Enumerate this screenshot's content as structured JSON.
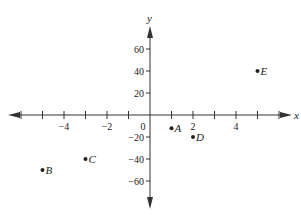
{
  "chart_data": {
    "type": "scatter",
    "title": "",
    "xlabel": "x",
    "ylabel": "y",
    "xlim": [
      -6.8,
      6.5
    ],
    "ylim": [
      -78,
      78
    ],
    "grid": false,
    "legend": null,
    "x_ticks": [
      -6,
      -5,
      -4,
      -3,
      -2,
      -1,
      1,
      2,
      3,
      4,
      5,
      6
    ],
    "x_tick_labels": [
      "-4",
      "-2",
      "0",
      "2",
      "4"
    ],
    "x_tick_label_values": [
      -4,
      -2,
      0,
      2,
      4
    ],
    "y_ticks": [
      -60,
      -40,
      -20,
      20,
      40,
      60
    ],
    "y_tick_labels": [
      "60",
      "40",
      "20",
      "-20",
      "-40",
      "-60"
    ],
    "y_tick_label_values": [
      60,
      40,
      20,
      -20,
      -40,
      -60
    ],
    "points": [
      {
        "label": "A",
        "x": 1,
        "y": -12
      },
      {
        "label": "B",
        "x": -5,
        "y": -50
      },
      {
        "label": "C",
        "x": -3,
        "y": -40
      },
      {
        "label": "D",
        "x": 2,
        "y": -20
      },
      {
        "label": "E",
        "x": 5,
        "y": 40
      }
    ]
  },
  "colors": {
    "axis": "#333333",
    "point": "#222222",
    "text": "#222222"
  }
}
